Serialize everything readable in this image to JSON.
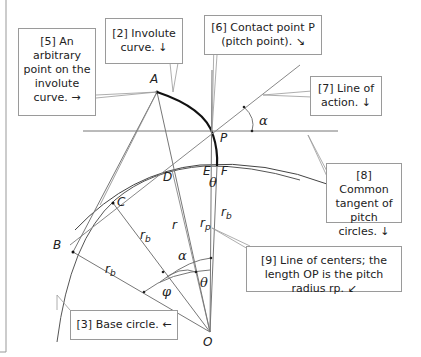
{
  "diagram": {
    "points": {
      "A": "A",
      "B": "B",
      "C": "C",
      "D": "D",
      "E": "E",
      "F": "F",
      "P": "P",
      "O": "O"
    },
    "symbols": {
      "r": "r",
      "r_p": "r",
      "r_p_sub": "p",
      "r_b": "r",
      "r_b_sub": "b",
      "alpha": "α",
      "theta": "θ",
      "phi": "φ"
    },
    "callouts": [
      {
        "id": "5",
        "text": "[5] An arbitrary point on the involute curve. →"
      },
      {
        "id": "2",
        "text": "[2] Involute curve. ↓"
      },
      {
        "id": "6",
        "text": "[6] Contact point P (pitch point). ↘"
      },
      {
        "id": "7",
        "text": "[7] Line of action. ↓"
      },
      {
        "id": "8",
        "text": "[8] Common tangent of pitch circles. ↓"
      },
      {
        "id": "9",
        "text": "[9] Line of centers; the length OP is the pitch radius rp. ↙"
      },
      {
        "id": "3",
        "text": "[3] Base circle. ←"
      }
    ],
    "colors": {
      "line": "#7a7a7a",
      "curve": "#111111",
      "border": "#9a9a9a",
      "text": "#222222"
    }
  }
}
